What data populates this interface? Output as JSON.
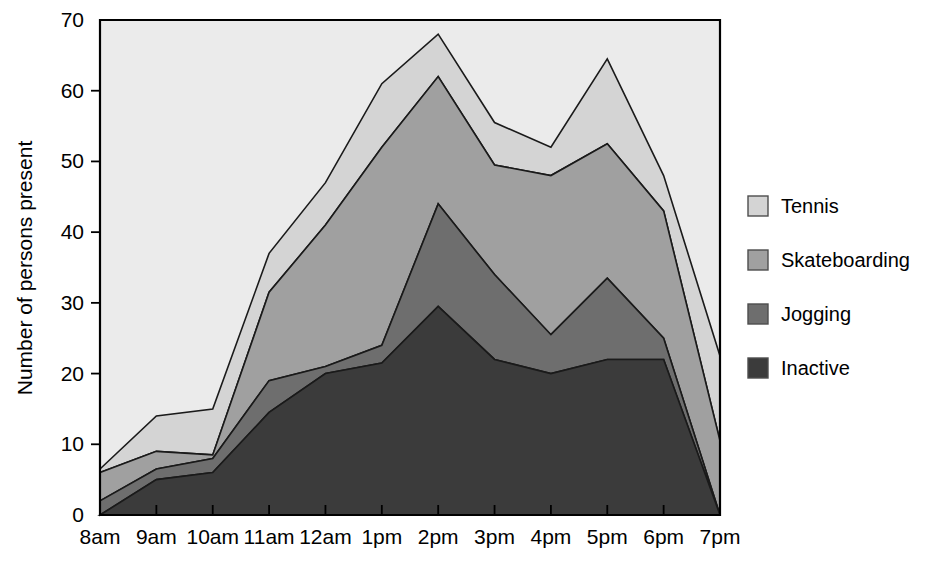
{
  "chart_data": {
    "type": "area",
    "stacked": true,
    "title": "",
    "subtitle": "",
    "xlabel": "",
    "ylabel": "Number of persons present",
    "categories": [
      "8am",
      "9am",
      "10am",
      "11am",
      "12am",
      "1pm",
      "2pm",
      "3pm",
      "4pm",
      "5pm",
      "6pm",
      "7pm"
    ],
    "ylim": [
      0,
      70
    ],
    "yticks": [
      0,
      10,
      20,
      30,
      40,
      50,
      60,
      70
    ],
    "ytick_labels": [
      "0",
      "10",
      "20",
      "30",
      "40",
      "50",
      "60",
      "70"
    ],
    "grid": false,
    "legend_position": "right",
    "series": [
      {
        "name": "Inactive",
        "color": "#3b3b3b",
        "values": [
          0,
          5,
          6,
          14.5,
          20,
          21.5,
          29.5,
          22,
          20,
          22,
          22,
          0
        ]
      },
      {
        "name": "Jogging",
        "color": "#6e6e6e",
        "values": [
          2,
          1.5,
          2,
          4.5,
          1,
          2.5,
          14.5,
          12,
          5.5,
          11.5,
          3,
          0
        ]
      },
      {
        "name": "Skateboarding",
        "color": "#a0a0a0",
        "values": [
          4,
          2.5,
          0.5,
          12.5,
          20,
          28,
          18,
          15.5,
          22.5,
          19,
          18,
          10.5
        ]
      },
      {
        "name": "Tennis",
        "color": "#d4d4d4",
        "values": [
          0.5,
          5,
          6.5,
          5.5,
          6,
          9,
          6,
          6,
          4,
          12,
          5,
          12
        ]
      }
    ],
    "cumulative_tops": {
      "Inactive": [
        0,
        5,
        6,
        14.5,
        20,
        21.5,
        29.5,
        22,
        20,
        22,
        22,
        0
      ],
      "Jogging": [
        2,
        6.5,
        8,
        19,
        21,
        24,
        44,
        34,
        25.5,
        33.5,
        25,
        0
      ],
      "Skateboarding": [
        6,
        9,
        8.5,
        31.5,
        41,
        52,
        62,
        49.5,
        48,
        52.5,
        43,
        10.5
      ],
      "Tennis": [
        6.5,
        14,
        15,
        37,
        47,
        61,
        68,
        55.5,
        52,
        64.5,
        48,
        22.5
      ]
    }
  },
  "legend": {
    "items": [
      {
        "label": "Tennis",
        "color": "#d4d4d4"
      },
      {
        "label": "Skateboarding",
        "color": "#a0a0a0"
      },
      {
        "label": "Jogging",
        "color": "#6e6e6e"
      },
      {
        "label": "Inactive",
        "color": "#3b3b3b"
      }
    ]
  },
  "axes": {
    "y_axis_title": "Number of persons present",
    "plot_background": "#ebebeb",
    "axis_color": "#000000"
  }
}
